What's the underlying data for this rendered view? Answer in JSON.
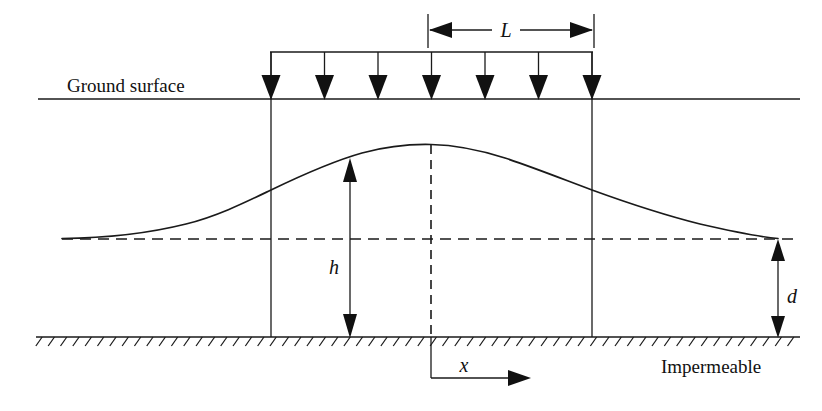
{
  "figure": {
    "background_color": "#ffffff",
    "line_color": "#1a1a1a",
    "width": 822,
    "height": 411
  },
  "labels": {
    "ground_surface": "Ground surface",
    "impermeable": "Impermeable",
    "recharge_width": "L",
    "mound_height": "h",
    "saturated_depth": "d",
    "horizontal_axis": "x"
  },
  "chart_data": {
    "type": "line",
    "xlabel": "x",
    "ylabel": "h",
    "grid": false,
    "legend": "none",
    "annotations": [
      {
        "name": "ground-surface",
        "text": "Ground surface",
        "x": 67,
        "y": 90
      },
      {
        "name": "impermeable",
        "text": "Impermeable",
        "x": 661,
        "y": 372
      },
      {
        "name": "recharge-width",
        "text": "L",
        "x": 505,
        "y": 30
      },
      {
        "name": "mound-height",
        "text": "h",
        "x": 334,
        "y": 272
      },
      {
        "name": "saturated-depth",
        "text": "d",
        "x": 786,
        "y": 300
      },
      {
        "name": "x-axis",
        "text": "x",
        "x": 463,
        "y": 372
      }
    ],
    "geometry": {
      "ground_surface_y": 99,
      "ground_surface_x0": 38,
      "ground_surface_x1": 800,
      "water_table_datum_y": 239,
      "water_table_datum_x0": 62,
      "water_table_datum_x1": 800,
      "impermeable_y": 337,
      "impermeable_x0": 36,
      "impermeable_x1": 800,
      "recharge_left_x": 271,
      "recharge_right_x": 592,
      "centerline_x": 431,
      "mound_crest_y": 145,
      "load_bar_y": 52,
      "dimension_line_y": 30,
      "dimension_tick_top_y": 14,
      "dimension_tick_bottom_y": 48,
      "d_arrow_x": 778,
      "h_arrow_x": 350,
      "h_arrow_top_y": 162,
      "h_arrow_bottom_y": 335,
      "x_axis_y": 378,
      "x_axis_arrow_x": 528,
      "arrow_count": 7
    },
    "mound_profile": {
      "comment": "water table elevation above impermeable base, sampled x:y in pixel space",
      "x": [
        62,
        100,
        140,
        180,
        215,
        245,
        271,
        300,
        330,
        360,
        395,
        431,
        465,
        500,
        530,
        560,
        592,
        625,
        660,
        700,
        740,
        778
      ],
      "y": [
        238,
        237,
        234,
        228,
        218,
        205,
        190,
        178,
        168,
        159,
        150,
        145,
        147,
        152,
        160,
        173,
        190,
        202,
        212,
        222,
        231,
        238
      ]
    }
  },
  "load_arrows": {
    "count": 7,
    "x_positions": [
      271,
      324.5,
      378,
      431.5,
      485,
      538.5,
      592
    ],
    "tip_y": 99,
    "tail_y": 52
  },
  "hatching": {
    "tick_count": 62,
    "tick_length": 11,
    "tick_angle_deg": 55,
    "x_start": 36,
    "x_end": 800,
    "baseline_y": 337
  }
}
